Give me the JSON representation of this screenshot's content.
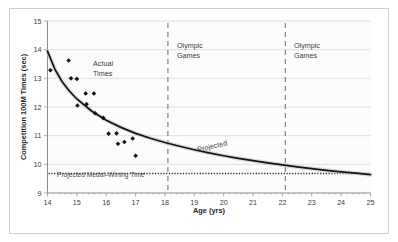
{
  "chart_data": {
    "type": "scatter",
    "title": "",
    "subtitle": "",
    "xlabel": "Age (yrs)",
    "ylabel": "Competition 100M Times (sec)",
    "xlim": [
      14,
      25
    ],
    "ylim": [
      9,
      15
    ],
    "xticks": [
      14,
      15,
      16,
      17,
      18,
      19,
      20,
      21,
      22,
      23,
      24,
      25
    ],
    "yticks": [
      9,
      10,
      11,
      12,
      13,
      14,
      15
    ],
    "xtick_labels": [
      "14",
      "15",
      "16",
      "17",
      "18",
      "19",
      "20",
      "21",
      "22",
      "23",
      "24",
      "25"
    ],
    "ytick_labels": [
      "9",
      "10",
      "11",
      "12",
      "13",
      "14",
      "15"
    ],
    "grid": "horizontal",
    "legend": "none",
    "series": [
      {
        "name": "Actual Times",
        "type": "scatter",
        "marker": "diamond",
        "color": "#111111",
        "points": [
          [
            14.1,
            13.28
          ],
          [
            14.72,
            13.62
          ],
          [
            14.8,
            13.0
          ],
          [
            15.0,
            12.98
          ],
          [
            15.02,
            12.05
          ],
          [
            15.3,
            12.47
          ],
          [
            15.33,
            12.1
          ],
          [
            15.58,
            12.47
          ],
          [
            15.62,
            11.78
          ],
          [
            15.9,
            11.62
          ],
          [
            16.08,
            11.07
          ],
          [
            16.35,
            11.08
          ],
          [
            16.4,
            10.72
          ],
          [
            16.62,
            10.78
          ],
          [
            16.9,
            10.9
          ],
          [
            17.0,
            10.3
          ]
        ]
      },
      {
        "name": "Projected",
        "type": "line",
        "color": "#1a1a1a",
        "description": "Smooth decaying fitted/projected curve from age 14 to age 25",
        "points": [
          [
            14.0,
            13.95
          ],
          [
            14.25,
            13.32
          ],
          [
            14.5,
            12.88
          ],
          [
            14.75,
            12.55
          ],
          [
            15.0,
            12.28
          ],
          [
            15.5,
            11.86
          ],
          [
            16.0,
            11.54
          ],
          [
            16.5,
            11.29
          ],
          [
            17.0,
            11.08
          ],
          [
            17.5,
            10.91
          ],
          [
            18.0,
            10.76
          ],
          [
            18.5,
            10.63
          ],
          [
            19.0,
            10.51
          ],
          [
            19.5,
            10.4
          ],
          [
            20.0,
            10.3
          ],
          [
            20.5,
            10.21
          ],
          [
            21.0,
            10.13
          ],
          [
            21.5,
            10.05
          ],
          [
            22.0,
            9.98
          ],
          [
            22.5,
            9.91
          ],
          [
            23.0,
            9.85
          ],
          [
            23.5,
            9.79
          ],
          [
            24.0,
            9.74
          ],
          [
            24.5,
            9.69
          ],
          [
            25.0,
            9.64
          ]
        ]
      },
      {
        "name": "Projected Medal–Wining Time",
        "type": "hline",
        "value": 9.68,
        "style": "dotted",
        "color": "#2b2b2b"
      }
    ],
    "vlines": [
      {
        "label": "Olympic Games",
        "x": 18.1,
        "style": "dashed",
        "color": "#8a8a8a"
      },
      {
        "label": "Olympic Games",
        "x": 22.1,
        "style": "dashed",
        "color": "#8a8a8a"
      }
    ],
    "annotations": [
      {
        "name": "actual-times-label",
        "text_line1": "Actual",
        "text_line2": "Times",
        "x": 16.1,
        "y": 12.5
      },
      {
        "name": "projected-curve-label",
        "text": "Projected",
        "x": 19.5,
        "y": 10.75,
        "rotation": -14
      },
      {
        "name": "medal-time-label",
        "text": "Projected Medal–Wining Time",
        "x": 14.35,
        "y": 9.82
      },
      {
        "name": "olympic-games-label-1",
        "text_line1": "Olympic",
        "text_line2": "Games",
        "x": 18.3,
        "y": 14.2
      },
      {
        "name": "olympic-games-label-2",
        "text_line1": "Olympic",
        "text_line2": "Games",
        "x": 22.3,
        "y": 14.2
      }
    ]
  },
  "axes": {
    "x_title": "Age (yrs)",
    "y_title": "Competition 100M Times (sec)"
  }
}
